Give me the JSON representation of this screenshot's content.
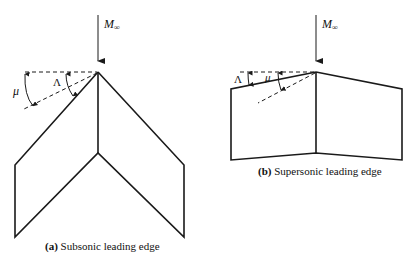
{
  "figure_a": {
    "freestream_label": "M",
    "freestream_subscript": "∞",
    "angle_mu": "μ",
    "angle_lambda": "Λ",
    "caption_letter": "(a)",
    "caption_text": " Subsonic leading edge"
  },
  "figure_b": {
    "freestream_label": "M",
    "freestream_subscript": "∞",
    "angle_mu": "μ",
    "angle_lambda": "Λ",
    "caption_letter": "(b)",
    "caption_text": " Supersonic leading edge"
  },
  "colors": {
    "line": "#1a1a1a",
    "background": "#ffffff"
  }
}
